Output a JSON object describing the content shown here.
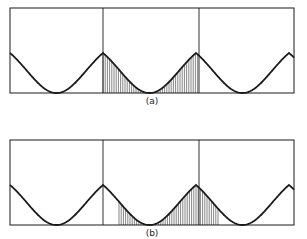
{
  "figure": {
    "panels": [
      {
        "id": "a",
        "label": "(a)",
        "box": {
          "x0": 10,
          "x1": 294,
          "y_top": 8,
          "y_base": 93
        },
        "dividers_x": [
          103,
          199
        ],
        "peak_y": 53,
        "peaks_x": [
          10,
          103,
          199,
          294
        ],
        "hatch_range_x": [
          103,
          199
        ],
        "label_pos": {
          "x": 152,
          "y": 104
        }
      },
      {
        "id": "b",
        "label": "(b)",
        "box": {
          "x0": 10,
          "x1": 294,
          "y_top": 140,
          "y_base": 225
        },
        "dividers_x": [
          103,
          199
        ],
        "peak_y": 185,
        "peaks_x": [
          10,
          103,
          199,
          294
        ],
        "hatch_range_x": [
          119,
          218
        ],
        "label_pos": {
          "x": 152,
          "y": 236
        }
      }
    ],
    "stroke_color": "#1a1a1a",
    "hatch_color": "#333333"
  }
}
